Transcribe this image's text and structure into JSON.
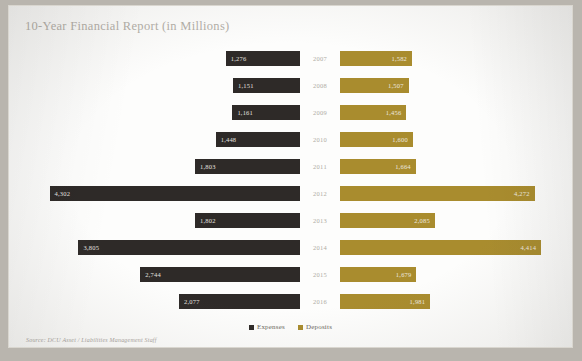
{
  "title": "10-Year Financial Report (in Millions)",
  "source": "Source: DCU Asset / Liabilities Management Staff",
  "legend": {
    "expenses_label": "Expenses",
    "deposits_label": "Deposits",
    "expenses_color": "#2e2a28",
    "deposits_color": "#a98c2e"
  },
  "chart_data": {
    "type": "bar",
    "subtype": "tornado",
    "title": "10-Year Financial Report (in Millions)",
    "xlabel": "",
    "ylabel": "",
    "grid": false,
    "legend_position": "bottom-center",
    "categories": [
      "2007",
      "2008",
      "2009",
      "2010",
      "2011",
      "2012",
      "2013",
      "2014",
      "2015",
      "2016"
    ],
    "series": [
      {
        "name": "Expenses",
        "color": "#2e2a28",
        "direction": "left",
        "values": [
          1276,
          1151,
          1161,
          1448,
          1803,
          4302,
          1802,
          3805,
          2744,
          2077
        ],
        "labels": [
          "1,276",
          "1,151",
          "1,161",
          "1,448",
          "1,803",
          "4,302",
          "1,802",
          "3,805",
          "2,744",
          "2,077"
        ]
      },
      {
        "name": "Deposits",
        "color": "#a98c2e",
        "direction": "right",
        "values": [
          1582,
          1507,
          1456,
          1600,
          1664,
          4272,
          2085,
          4414,
          1679,
          1981
        ],
        "labels": [
          "1,582",
          "1,507",
          "1,456",
          "1,600",
          "1,664",
          "4,272",
          "2,085",
          "4,414",
          "1,679",
          "1,981"
        ]
      }
    ],
    "axis_max": 4500,
    "units": "Millions",
    "annotations": []
  }
}
